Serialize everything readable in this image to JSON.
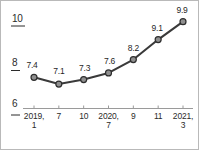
{
  "chart_data": {
    "type": "line",
    "title": "",
    "subtitle": "",
    "xlabel": "",
    "ylabel": "",
    "grid": false,
    "legend": false,
    "ylim": [
      6,
      10
    ],
    "yticks": [
      "6",
      "8",
      "10"
    ],
    "ytick_values": [
      6,
      8,
      10
    ],
    "categories": [
      "2019,\n1",
      "7",
      "10",
      "2020,\n7",
      "9",
      "11",
      "2021,\n3"
    ],
    "xtick_labels": [
      {
        "line1": "2019,",
        "line2": "1"
      },
      {
        "line1": "7",
        "line2": ""
      },
      {
        "line1": "10",
        "line2": ""
      },
      {
        "line1": "2020,",
        "line2": "7"
      },
      {
        "line1": "9",
        "line2": ""
      },
      {
        "line1": "11",
        "line2": ""
      },
      {
        "line1": "2021,",
        "line2": "3"
      }
    ],
    "values": [
      7.4,
      7.1,
      7.3,
      7.6,
      8.2,
      9.1,
      9.9
    ],
    "point_labels": [
      "7.4",
      "7.1",
      "7.3",
      "7.6",
      "8.2",
      "9.1",
      "9.9"
    ],
    "series": [
      {
        "name": "",
        "values": [
          7.4,
          7.1,
          7.3,
          7.6,
          8.2,
          9.1,
          9.9
        ]
      }
    ],
    "colors": {
      "line": "#3a3a3a",
      "marker_fill": "#8f8f8f",
      "marker_edge": "#2e2e2e",
      "axis": "#9a9a9a",
      "text": "#2b2b2b",
      "frame": "#b9b9b9",
      "background": "#ffffff"
    }
  }
}
